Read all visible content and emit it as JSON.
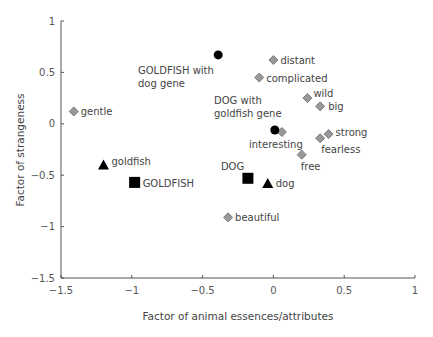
{
  "chart_data": {
    "type": "scatter",
    "title": "",
    "xlabel": "Factor of animal essences/attributes",
    "ylabel": "Factor of strangeness",
    "xlim": [
      -1.5,
      1
    ],
    "ylim": [
      -1.5,
      1
    ],
    "xticks": [
      -1.5,
      -1,
      -0.5,
      0,
      0.5,
      1
    ],
    "xtick_labels": [
      "−1.5",
      "−1",
      "−0.5",
      "0",
      "0.5",
      "1"
    ],
    "yticks": [
      1,
      0.5,
      0,
      -0.5,
      -1,
      -1.5
    ],
    "ytick_labels": [
      "1",
      "0.5",
      "0",
      "−0.5",
      "−1",
      "−1.5"
    ],
    "grid": false,
    "legend": null,
    "series": [
      {
        "name": "attributes",
        "marker": "diamond",
        "color": "#999999",
        "points": [
          {
            "label": "distant",
            "x": 0.0,
            "y": 0.62
          },
          {
            "label": "complicated",
            "x": -0.1,
            "y": 0.45
          },
          {
            "label": "wild",
            "x": 0.24,
            "y": 0.25
          },
          {
            "label": "big",
            "x": 0.33,
            "y": 0.17
          },
          {
            "label": "gentle",
            "x": -1.41,
            "y": 0.12
          },
          {
            "label": "interesting",
            "x": 0.06,
            "y": -0.08
          },
          {
            "label": "strong",
            "x": 0.39,
            "y": -0.1
          },
          {
            "label": "fearless",
            "x": 0.33,
            "y": -0.14
          },
          {
            "label": "free",
            "x": 0.2,
            "y": -0.3
          },
          {
            "label": "beautiful",
            "x": -0.32,
            "y": -0.91
          }
        ]
      },
      {
        "name": "hybrid concepts",
        "marker": "circle",
        "color": "#000000",
        "points": [
          {
            "label": "GOLDFISH with dog gene",
            "x": -0.39,
            "y": 0.67
          },
          {
            "label": "DOG with goldfish gene",
            "x": 0.01,
            "y": -0.06
          }
        ]
      },
      {
        "name": "concepts (uppercase)",
        "marker": "square",
        "color": "#000000",
        "points": [
          {
            "label": "GOLDFISH",
            "x": -0.98,
            "y": -0.57
          },
          {
            "label": "DOG",
            "x": -0.18,
            "y": -0.53
          }
        ]
      },
      {
        "name": "words (lowercase)",
        "marker": "triangle",
        "color": "#000000",
        "points": [
          {
            "label": "goldfish",
            "x": -1.2,
            "y": -0.4
          },
          {
            "label": "dog",
            "x": -0.04,
            "y": -0.58
          }
        ]
      }
    ]
  }
}
